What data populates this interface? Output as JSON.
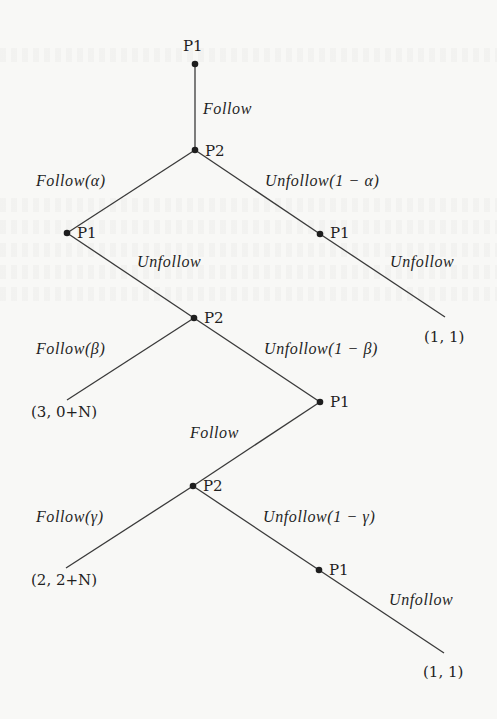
{
  "diagram": {
    "type": "extensive-form game tree",
    "nodes": {
      "n0": {
        "player": "P1",
        "x": 195,
        "y": 64
      },
      "n1": {
        "player": "P2",
        "x": 195,
        "y": 150
      },
      "n2": {
        "player": "P1",
        "x": 67,
        "y": 233
      },
      "n3": {
        "player": "P1",
        "x": 320,
        "y": 234
      },
      "n4": {
        "player": "P2",
        "x": 194,
        "y": 318
      },
      "n5": {
        "player": "P1",
        "x": 320,
        "y": 402
      },
      "n6": {
        "player": "P2",
        "x": 193,
        "y": 486
      },
      "n7": {
        "player": "P1",
        "x": 319,
        "y": 570
      }
    },
    "edges": [
      {
        "from": "n0",
        "to": "n1",
        "label": "Follow"
      },
      {
        "from": "n1",
        "to": "n2",
        "label": "Follow(α)"
      },
      {
        "from": "n1",
        "to": "n3",
        "label": "Unfollow(1 − α)"
      },
      {
        "from": "n3",
        "to": "t0",
        "label": "Unfollow"
      },
      {
        "from": "n2",
        "to": "n4",
        "label": "Unfollow"
      },
      {
        "from": "n4",
        "to": "t1",
        "label": "Follow(β)"
      },
      {
        "from": "n4",
        "to": "n5",
        "label": "Unfollow(1 − β)"
      },
      {
        "from": "n5",
        "to": "n6",
        "label": "Follow"
      },
      {
        "from": "n6",
        "to": "t2",
        "label": "Follow(γ)"
      },
      {
        "from": "n6",
        "to": "n7",
        "label": "Unfollow(1 − γ)"
      },
      {
        "from": "n7",
        "to": "t3",
        "label": "Unfollow"
      }
    ],
    "terminals": {
      "t0": {
        "payoff": "(1, 1)",
        "x": 445,
        "y": 317
      },
      "t1": {
        "payoff": "(3, 0+N)",
        "x": 67,
        "y": 400
      },
      "t2": {
        "payoff": "(2, 2+N)",
        "x": 66,
        "y": 568
      },
      "t3": {
        "payoff": "(1, 1)",
        "x": 444,
        "y": 653
      }
    }
  },
  "labels": {
    "players": {
      "root": "P1",
      "p2_top": "P2",
      "p1_left": "P1",
      "p1_right": "P1",
      "p2_mid": "P2",
      "p1_mid": "P1",
      "p2_low": "P2",
      "p1_low": "P1"
    },
    "actions": {
      "root_follow": "Follow",
      "follow_alpha": "Follow(α)",
      "unfollow_alpha": "Unfollow(1 − α)",
      "right_unfollow": "Unfollow",
      "left_unfollow": "Unfollow",
      "follow_beta": "Follow(β)",
      "unfollow_beta": "Unfollow(1 − β)",
      "mid_follow": "Follow",
      "follow_gamma": "Follow(γ)",
      "unfollow_gamma": "Unfollow(1 − γ)",
      "low_unfollow": "Unfollow"
    },
    "payoffs": {
      "top_right": "(1, 1)",
      "mid_left": "(3, 0+N)",
      "low_left": "(2, 2+N)",
      "bottom_right": "(1, 1)"
    }
  },
  "colors": {
    "background": "#f8f8f6",
    "ink": "#1f1f1f",
    "edge": "#3a3a3a"
  }
}
